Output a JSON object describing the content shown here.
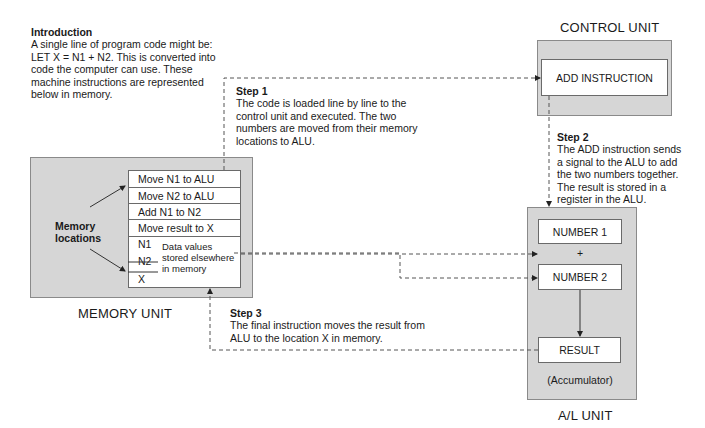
{
  "introduction": {
    "title": "Introduction",
    "lines": [
      "A single line of program code might be:",
      "LET X = N1 + N2. This is converted into",
      "code the computer can use. These",
      "machine instructions are represented",
      "below in memory."
    ]
  },
  "step1": {
    "title": "Step 1",
    "lines": [
      "The code is loaded line by line to the",
      "control unit and executed. The two",
      "numbers are moved from their memory",
      "locations to ALU."
    ]
  },
  "step2": {
    "title": "Step 2",
    "lines": [
      "The ADD instruction sends",
      "a signal to the ALU to add",
      "the two numbers together.",
      "The result is stored in a",
      "register in the ALU."
    ]
  },
  "step3": {
    "title": "Step 3",
    "lines": [
      "The final instruction moves the result from",
      "ALU to the location X in memory."
    ]
  },
  "memory_unit": {
    "label": "MEMORY UNIT",
    "locations_label": [
      "Memory",
      "locations"
    ],
    "instructions": [
      "Move N1 to ALU",
      "Move N2 to ALU",
      "Add N1 to N2",
      "Move result to X"
    ],
    "data_cells": [
      "N1",
      "N2",
      "X"
    ],
    "data_note": [
      "Data values",
      "stored elsewhere",
      "in memory"
    ]
  },
  "control_unit": {
    "label": "CONTROL UNIT",
    "instruction": "ADD INSTRUCTION"
  },
  "alu": {
    "label": "A/L UNIT",
    "number1": "NUMBER 1",
    "plus": "+",
    "number2": "NUMBER 2",
    "result": "RESULT",
    "accumulator": "(Accumulator)"
  },
  "colors": {
    "unit_fill": "#d6d6d6",
    "box_fill": "#ffffff",
    "line": "#555555"
  }
}
